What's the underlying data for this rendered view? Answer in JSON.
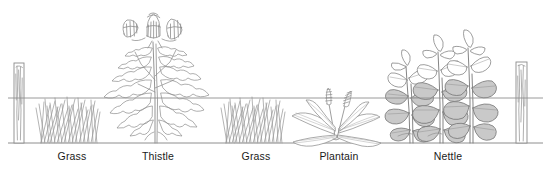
{
  "figure": {
    "background_color": "#ffffff",
    "line_color": "#8a8a8a",
    "outline_color": "#707070",
    "leaf_fill_color": "#c9c9c9",
    "label_color": "#1a1a1a",
    "ground_line_y": 143,
    "wire_line_y": 98
  },
  "posts": [
    {
      "name": "left-post",
      "x": 14,
      "label": ""
    },
    {
      "name": "right-post",
      "x": 516,
      "label": ""
    }
  ],
  "plants": [
    {
      "id": "grass-1",
      "label": "Grass",
      "label_x": 72,
      "label_y": 150,
      "icon": "grass-icon"
    },
    {
      "id": "thistle",
      "label": "Thistle",
      "label_x": 158,
      "label_y": 150,
      "icon": "thistle-icon"
    },
    {
      "id": "grass-2",
      "label": "Grass",
      "label_x": 256,
      "label_y": 150,
      "icon": "grass-icon"
    },
    {
      "id": "plantain",
      "label": "Plantain",
      "label_x": 339,
      "label_y": 150,
      "icon": "plantain-icon"
    },
    {
      "id": "nettle",
      "label": "Nettle",
      "label_x": 448,
      "label_y": 150,
      "icon": "nettle-icon"
    }
  ]
}
